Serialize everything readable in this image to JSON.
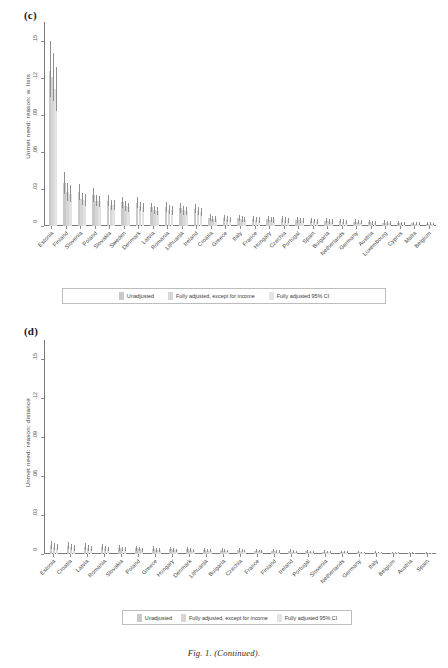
{
  "figure": {
    "caption": "Fig. 1. (Continued)."
  },
  "legend": {
    "items": [
      {
        "label": "Unadjusted",
        "color": "#c9c9c9"
      },
      {
        "label": "Fully adjusted, except for income",
        "color": "#d6d6d6"
      },
      {
        "label": "Fully adjusted  95% CI",
        "color": "#e4e4e4"
      }
    ]
  },
  "chart_data": [
    {
      "type": "bar",
      "panel": "(c)",
      "title": "",
      "xlabel": "",
      "ylabel": "Unmet need: reason: w. lists",
      "ylim": [
        0,
        0.165
      ],
      "yticks": [
        0,
        0.03,
        0.06,
        0.09,
        0.12,
        0.15
      ],
      "ytick_labels": [
        "0",
        ".03",
        ".06",
        ".09",
        ".12",
        ".15"
      ],
      "grid": false,
      "legend_position": "below",
      "categories": [
        "Estonia",
        "Finland",
        "Slovenia",
        "Poland",
        "Slovakia",
        "Sweden",
        "Denmark",
        "Latvia",
        "Romania",
        "Lithuania",
        "Ireland",
        "Croatia",
        "Greece",
        "Italy",
        "France",
        "Hungary",
        "Czechia",
        "Portugal",
        "Spain",
        "Bulgaria",
        "Netherlands",
        "Germany",
        "Austria",
        "Luxembourg",
        "Cyprus",
        "Malta",
        "Belgium"
      ],
      "series": [
        {
          "name": "Unadjusted",
          "values": [
            0.1255,
            0.0345,
            0.0272,
            0.025,
            0.0205,
            0.0192,
            0.019,
            0.015,
            0.0155,
            0.0148,
            0.014,
            0.0068,
            0.0063,
            0.0063,
            0.0058,
            0.0058,
            0.0055,
            0.005,
            0.0045,
            0.0042,
            0.004,
            0.0035,
            0.003,
            0.0028,
            0.0025,
            0.0022,
            0.002
          ],
          "ci_low": [
            0.104,
            0.0255,
            0.021,
            0.0198,
            0.0158,
            0.0148,
            0.0145,
            0.0112,
            0.0115,
            0.0108,
            0.0103,
            0.0042,
            0.0038,
            0.0038,
            0.0034,
            0.0034,
            0.0032,
            0.0028,
            0.0024,
            0.0022,
            0.0021,
            0.0017,
            0.0014,
            0.0012,
            0.0011,
            0.0009,
            0.0008
          ],
          "ci_high": [
            0.15,
            0.044,
            0.0338,
            0.0305,
            0.0252,
            0.0238,
            0.0235,
            0.019,
            0.0196,
            0.019,
            0.018,
            0.0095,
            0.0089,
            0.0089,
            0.0083,
            0.0083,
            0.0079,
            0.0073,
            0.0067,
            0.0063,
            0.006,
            0.0054,
            0.0047,
            0.0045,
            0.004,
            0.0036,
            0.0033
          ]
        },
        {
          "name": "Fully adjusted, except for income",
          "values": [
            0.1205,
            0.0272,
            0.0218,
            0.0205,
            0.0172,
            0.0162,
            0.016,
            0.0128,
            0.0132,
            0.0126,
            0.012,
            0.006,
            0.0056,
            0.0056,
            0.0052,
            0.0052,
            0.0049,
            0.0045,
            0.004,
            0.0038,
            0.0036,
            0.0031,
            0.0027,
            0.0025,
            0.0022,
            0.002,
            0.0018
          ],
          "ci_low": [
            0.101,
            0.02,
            0.0168,
            0.016,
            0.0132,
            0.0124,
            0.0122,
            0.0094,
            0.0098,
            0.0092,
            0.0088,
            0.0036,
            0.0033,
            0.0033,
            0.003,
            0.003,
            0.0028,
            0.0025,
            0.0021,
            0.0019,
            0.0018,
            0.0015,
            0.0012,
            0.0011,
            0.0009,
            0.0008,
            0.0007
          ],
          "ci_high": [
            0.14,
            0.0345,
            0.027,
            0.0252,
            0.0212,
            0.02,
            0.0198,
            0.0163,
            0.0167,
            0.016,
            0.0153,
            0.0085,
            0.008,
            0.008,
            0.0075,
            0.0075,
            0.0071,
            0.0066,
            0.006,
            0.0057,
            0.0055,
            0.0048,
            0.0043,
            0.004,
            0.0036,
            0.0033,
            0.003
          ]
        },
        {
          "name": "Fully adjusted  95% CI",
          "values": [
            0.1105,
            0.0262,
            0.0212,
            0.02,
            0.0168,
            0.0152,
            0.015,
            0.0122,
            0.0126,
            0.012,
            0.0115,
            0.0056,
            0.0052,
            0.0052,
            0.0048,
            0.0048,
            0.0045,
            0.0041,
            0.0037,
            0.0035,
            0.0033,
            0.0029,
            0.0025,
            0.0023,
            0.002,
            0.0018,
            0.0016
          ],
          "ci_low": [
            0.093,
            0.0192,
            0.0162,
            0.0155,
            0.0128,
            0.0115,
            0.0113,
            0.0089,
            0.0093,
            0.0087,
            0.0083,
            0.0033,
            0.003,
            0.003,
            0.0027,
            0.0027,
            0.0025,
            0.0022,
            0.0019,
            0.0017,
            0.0016,
            0.0013,
            0.0011,
            0.0009,
            0.0008,
            0.0007,
            0.0006
          ],
          "ci_high": [
            0.1285,
            0.0335,
            0.0263,
            0.0246,
            0.0208,
            0.019,
            0.0188,
            0.0156,
            0.016,
            0.0153,
            0.0147,
            0.008,
            0.0075,
            0.0075,
            0.007,
            0.007,
            0.0066,
            0.0061,
            0.0056,
            0.0053,
            0.0051,
            0.0045,
            0.004,
            0.0037,
            0.0033,
            0.003,
            0.0027
          ]
        }
      ]
    },
    {
      "type": "bar",
      "panel": "(d)",
      "title": "",
      "xlabel": "",
      "ylabel": "Unmet need: reason: distance",
      "ylim": [
        0,
        0.165
      ],
      "yticks": [
        0,
        0.03,
        0.06,
        0.09,
        0.12,
        0.15
      ],
      "ytick_labels": [
        "0",
        ".03",
        ".06",
        ".09",
        ".12",
        ".15"
      ],
      "grid": false,
      "legend_position": "below",
      "categories": [
        "Estonia",
        "Croatia",
        "Latvia",
        "Romania",
        "Slovakia",
        "Poland",
        "Greece",
        "Hungary",
        "Denmark",
        "Lithuania",
        "Bulgaria",
        "Czechia",
        "France",
        "Finland",
        "Ireland",
        "Portugal",
        "Slovenia",
        "Netherlands",
        "Germany",
        "Italy",
        "Belgium",
        "Austria",
        "Spain"
      ],
      "series": [
        {
          "name": "Unadjusted",
          "values": [
            0.0068,
            0.0062,
            0.0056,
            0.0052,
            0.0048,
            0.0044,
            0.004,
            0.0037,
            0.0035,
            0.0033,
            0.0031,
            0.0029,
            0.0027,
            0.0025,
            0.0023,
            0.0021,
            0.0019,
            0.0017,
            0.0015,
            0.0013,
            0.0011,
            0.0009,
            0.0008
          ],
          "ci_low": [
            0.004,
            0.0036,
            0.0032,
            0.0029,
            0.0027,
            0.0024,
            0.0022,
            0.002,
            0.0019,
            0.0018,
            0.0016,
            0.0015,
            0.0014,
            0.0013,
            0.0012,
            0.0011,
            0.001,
            0.0009,
            0.0008,
            0.0007,
            0.0005,
            0.0004,
            0.0003
          ],
          "ci_high": [
            0.0098,
            0.009,
            0.0082,
            0.0076,
            0.007,
            0.0065,
            0.0059,
            0.0055,
            0.0052,
            0.0049,
            0.0046,
            0.0043,
            0.004,
            0.0038,
            0.0035,
            0.0032,
            0.0029,
            0.0026,
            0.0023,
            0.002,
            0.0017,
            0.0015,
            0.0013
          ]
        },
        {
          "name": "Fully adjusted, except for income",
          "values": [
            0.0056,
            0.0051,
            0.0047,
            0.0043,
            0.004,
            0.0036,
            0.0033,
            0.0031,
            0.0029,
            0.0027,
            0.0026,
            0.0024,
            0.0022,
            0.0021,
            0.0019,
            0.0017,
            0.0016,
            0.0014,
            0.0013,
            0.0011,
            0.0009,
            0.0008,
            0.0006
          ],
          "ci_low": [
            0.0032,
            0.0029,
            0.0026,
            0.0024,
            0.0022,
            0.002,
            0.0018,
            0.0017,
            0.0016,
            0.0015,
            0.0014,
            0.0013,
            0.0012,
            0.0011,
            0.001,
            0.0009,
            0.0008,
            0.0007,
            0.0006,
            0.0005,
            0.0004,
            0.0003,
            0.0002
          ],
          "ci_high": [
            0.0082,
            0.0075,
            0.0069,
            0.0063,
            0.0058,
            0.0053,
            0.0049,
            0.0046,
            0.0043,
            0.004,
            0.0038,
            0.0035,
            0.0033,
            0.0031,
            0.0029,
            0.0026,
            0.0024,
            0.0022,
            0.0019,
            0.0017,
            0.0014,
            0.0012,
            0.0011
          ]
        },
        {
          "name": "Fully adjusted  95% CI",
          "values": [
            0.005,
            0.0046,
            0.0042,
            0.0039,
            0.0036,
            0.0033,
            0.003,
            0.0028,
            0.0026,
            0.0025,
            0.0023,
            0.0022,
            0.002,
            0.0019,
            0.0017,
            0.0016,
            0.0014,
            0.0013,
            0.0011,
            0.001,
            0.0008,
            0.0007,
            0.0006
          ],
          "ci_low": [
            0.0028,
            0.0026,
            0.0024,
            0.0022,
            0.002,
            0.0018,
            0.0016,
            0.0015,
            0.0014,
            0.0014,
            0.0013,
            0.0012,
            0.0011,
            0.001,
            0.0009,
            0.0008,
            0.0007,
            0.0007,
            0.0006,
            0.0005,
            0.0004,
            0.0003,
            0.0002
          ],
          "ci_high": [
            0.0074,
            0.0068,
            0.0062,
            0.0057,
            0.0053,
            0.0048,
            0.0045,
            0.0042,
            0.0039,
            0.0037,
            0.0034,
            0.0032,
            0.003,
            0.0028,
            0.0026,
            0.0024,
            0.0022,
            0.002,
            0.0017,
            0.0015,
            0.0013,
            0.0011,
            0.001
          ]
        }
      ]
    }
  ]
}
